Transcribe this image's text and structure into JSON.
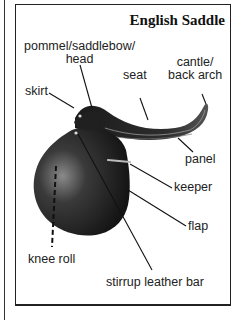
{
  "title": "English Saddle",
  "labels": {
    "pommel_line1": "pommel/saddlebow/",
    "pommel_line2": "head",
    "seat": "seat",
    "cantle_line1": "cantle/",
    "cantle_line2": "back arch",
    "skirt": "skirt",
    "panel": "panel",
    "keeper": "keeper",
    "flap": "flap",
    "knee_roll": "knee roll",
    "stirrup_leather_bar": "stirrup leather bar"
  },
  "colors": {
    "saddle_dark": "#1c1c1c",
    "saddle_mid": "#3a3a3a",
    "saddle_highlight": "#8a8a8a",
    "line": "#111111",
    "border": "#222222"
  }
}
